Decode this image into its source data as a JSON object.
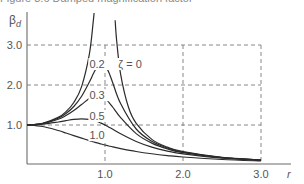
{
  "caption": "Figure 3.6 Damped magnification factor",
  "chart_data": {
    "type": "line",
    "title": "",
    "xlabel": "r",
    "ylabel": "βd",
    "ylabel_main": "β",
    "ylabel_sub": "d",
    "xlim": [
      0,
      3.0
    ],
    "ylim": [
      0,
      3.8
    ],
    "x_ticks": [
      1.0,
      2.0,
      3.0
    ],
    "x_tick_labels": [
      "1.0",
      "2.0",
      "3.0"
    ],
    "y_ticks": [
      1.0,
      2.0,
      3.0
    ],
    "y_tick_labels": [
      "1.0",
      "2.0",
      "3.0"
    ],
    "grid": "dashed at r = 1, 2, 3 and βd = 1, 2, 3",
    "legend": "inline curve labels",
    "x": [
      0,
      0.2,
      0.4,
      0.5,
      0.6,
      0.7,
      0.8,
      0.85,
      0.9,
      0.95,
      1.0,
      1.05,
      1.1,
      1.2,
      1.4,
      1.6,
      1.8,
      2.0,
      2.5,
      3.0
    ],
    "series": [
      {
        "name": "ζ = 0",
        "label": "ζ = 0",
        "zeta": 0,
        "branches": [
          {
            "x": [
              0,
              0.2,
              0.4,
              0.5,
              0.6,
              0.7,
              0.8,
              0.85,
              0.86
            ],
            "values": [
              1.0,
              1.042,
              1.19,
              1.333,
              1.563,
              1.961,
              2.778,
              3.604,
              3.83
            ]
          },
          {
            "x": [
              1.13,
              1.15,
              1.2,
              1.3,
              1.4,
              1.6,
              1.8,
              2.0,
              2.5,
              3.0
            ],
            "values": [
              3.62,
              3.101,
              2.273,
              1.449,
              1.042,
              0.641,
              0.446,
              0.333,
              0.19,
              0.125
            ]
          }
        ]
      },
      {
        "name": "ζ = 0.2",
        "label": "0.2",
        "zeta": 0.2,
        "values": [
          1.0,
          1.038,
          1.169,
          1.288,
          1.463,
          1.719,
          2.076,
          2.279,
          2.457,
          2.549,
          2.5,
          2.313,
          2.051,
          1.536,
          0.9,
          0.593,
          0.425,
          0.322,
          0.187,
          0.124
        ]
      },
      {
        "name": "ζ = 0.3",
        "label": "0.3",
        "zeta": 0.3,
        "values": [
          1.0,
          1.034,
          1.145,
          1.238,
          1.362,
          1.514,
          1.667,
          1.722,
          1.747,
          1.729,
          1.667,
          1.567,
          1.444,
          1.185,
          0.784,
          0.546,
          0.402,
          0.309,
          0.183,
          0.122
        ]
      },
      {
        "name": "ζ = 0.5",
        "label": "0.5",
        "zeta": 0.5,
        "values": [
          1.0,
          1.02,
          1.075,
          1.109,
          1.14,
          1.155,
          1.14,
          1.115,
          1.087,
          1.046,
          1.0,
          0.946,
          0.893,
          0.782,
          0.589,
          0.448,
          0.348,
          0.277,
          0.172,
          0.117
        ]
      },
      {
        "name": "ζ = 1.0",
        "label": "1.0",
        "zeta": 1.0,
        "values": [
          1.0,
          0.962,
          0.862,
          0.8,
          0.735,
          0.671,
          0.61,
          0.581,
          0.552,
          0.526,
          0.5,
          0.476,
          0.452,
          0.41,
          0.338,
          0.281,
          0.236,
          0.2,
          0.138,
          0.1
        ]
      }
    ],
    "annotations": [
      {
        "text": "0.2",
        "x": 0.8,
        "y": 2.45
      },
      {
        "text": "ζ = 0",
        "x": 1.17,
        "y": 2.45
      },
      {
        "text": "0.3",
        "x": 0.8,
        "y": 1.67
      },
      {
        "text": "0.5",
        "x": 0.8,
        "y": 1.15
      },
      {
        "text": "1.0",
        "x": 0.8,
        "y": 0.67
      }
    ],
    "colors": {
      "curve": "#2b2b2b",
      "axis": "#6b6b6b",
      "grid": "#7a7a7a",
      "text": "#555555"
    }
  }
}
